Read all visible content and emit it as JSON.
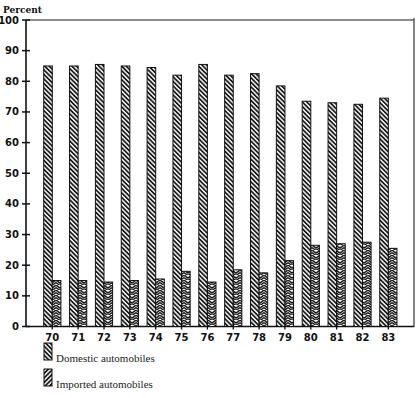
{
  "chart_data": {
    "type": "bar",
    "title": "",
    "xlabel": "",
    "ylabel": "Percent",
    "ylim": [
      0,
      100
    ],
    "yticks": [
      0,
      10,
      20,
      30,
      40,
      50,
      60,
      70,
      80,
      90,
      100
    ],
    "grid": false,
    "legend_position": "bottom-left",
    "categories": [
      "70",
      "71",
      "72",
      "73",
      "74",
      "75",
      "76",
      "77",
      "78",
      "79",
      "80",
      "81",
      "82",
      "83"
    ],
    "series": [
      {
        "name": "Domestic automobiles",
        "pattern": "hatch-diagonal",
        "values": [
          85,
          85,
          85.5,
          85,
          84.5,
          82,
          85.5,
          82,
          82.5,
          78.5,
          73.5,
          73,
          72.5,
          74.5
        ]
      },
      {
        "name": "Imported automobiles",
        "pattern": "hatch-chevron",
        "values": [
          15,
          15,
          14.5,
          15,
          15.5,
          18,
          14.5,
          18.5,
          17.5,
          21.5,
          26.5,
          27,
          27.5,
          25.5
        ]
      }
    ]
  },
  "colors": {
    "ink": "#111111",
    "frame": "#555555"
  }
}
